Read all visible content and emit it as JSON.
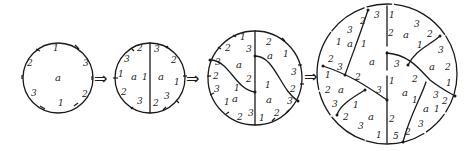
{
  "diagram": {
    "type": "sequence of subdivided discs (hand-drawn)",
    "arrows": [
      "⇒",
      "⇒",
      "⇒"
    ],
    "stages": [
      {
        "id": "stage-1",
        "face_label": "a",
        "boundary_labels": [
          "1",
          "3",
          "2",
          "1",
          "3",
          "2"
        ]
      },
      {
        "id": "stage-2",
        "face_labels": [
          "a",
          "a"
        ],
        "interior_edge_label": "1",
        "left_boundary_labels": [
          "2",
          "3",
          "1",
          "2",
          "3"
        ],
        "right_boundary_labels": [
          "3",
          "2",
          "1",
          "3",
          "2"
        ]
      },
      {
        "id": "stage-3",
        "face_labels": [
          "a",
          "a",
          "a",
          "a"
        ],
        "labels": {
          "top_left": [
            "1",
            "2",
            "3",
            "3"
          ],
          "left_lower": [
            "2",
            "3",
            "1",
            "1",
            "2",
            "3"
          ],
          "center": [
            "2",
            "1"
          ],
          "right_upper": [
            "2",
            "1",
            "3",
            "2"
          ],
          "right_lower": [
            "1",
            "3",
            "2",
            "1"
          ]
        }
      },
      {
        "id": "stage-4",
        "face_labels": [
          "a",
          "a",
          "a",
          "a",
          "a",
          "a",
          "a",
          "a"
        ],
        "labels": {
          "top_left": [
            "3",
            "2",
            "3",
            "1",
            "2",
            "3",
            "1"
          ],
          "top_right": [
            "1",
            "3",
            "2",
            "1",
            "3",
            "2"
          ],
          "center": [
            "2",
            "1",
            "3",
            "2"
          ],
          "left_lower": [
            "1",
            "2",
            "2",
            "3",
            "1",
            "3",
            "2",
            "3",
            "1"
          ],
          "right_lower": [
            "1",
            "3",
            "2",
            "1",
            "1",
            "2",
            "3",
            "5",
            "2"
          ]
        }
      }
    ]
  }
}
